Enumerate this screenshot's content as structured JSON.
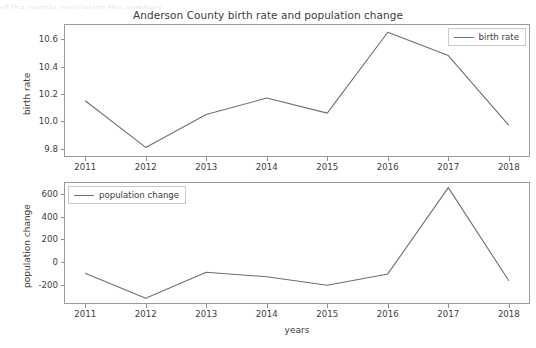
{
  "figure": {
    "title": "Anderson County birth rate and population change",
    "top_bleed_text": "of the people population the numbers"
  },
  "chart_data": [
    {
      "type": "line",
      "id": "birth-rate",
      "title": "Anderson County birth rate and population change",
      "xlabel": "",
      "ylabel": "birth rate",
      "legend": [
        "birth rate"
      ],
      "legend_position": "upper right",
      "grid": false,
      "x": [
        2011,
        2012,
        2013,
        2014,
        2015,
        2016,
        2017,
        2018
      ],
      "categories": [
        "2011",
        "2012",
        "2013",
        "2014",
        "2015",
        "2016",
        "2017",
        "2018"
      ],
      "xtick_labels": [
        "2011",
        "2012",
        "2013",
        "2014",
        "2015",
        "2016",
        "2017",
        "2018"
      ],
      "ytick_labels": [
        "9.8",
        "10.0",
        "10.2",
        "10.4",
        "10.6"
      ],
      "yticks": [
        9.8,
        10.0,
        10.2,
        10.4,
        10.6
      ],
      "ylim": [
        9.74,
        10.71
      ],
      "xlim": [
        2010.65,
        2018.35
      ],
      "series": [
        {
          "name": "birth rate",
          "color": "#6f6f6f",
          "values": [
            10.15,
            9.81,
            10.05,
            10.17,
            10.06,
            10.65,
            10.48,
            9.97
          ]
        }
      ]
    },
    {
      "type": "line",
      "id": "population-change",
      "title": "",
      "xlabel": "years",
      "ylabel": "population change",
      "legend": [
        "population change"
      ],
      "legend_position": "upper left",
      "grid": false,
      "x": [
        2011,
        2012,
        2013,
        2014,
        2015,
        2016,
        2017,
        2018
      ],
      "categories": [
        "2011",
        "2012",
        "2013",
        "2014",
        "2015",
        "2016",
        "2017",
        "2018"
      ],
      "xtick_labels": [
        "2011",
        "2012",
        "2013",
        "2014",
        "2015",
        "2016",
        "2017",
        "2018"
      ],
      "ytick_labels": [
        "-200",
        "0",
        "200",
        "400",
        "600"
      ],
      "yticks": [
        -200,
        0,
        200,
        400,
        600
      ],
      "ylim": [
        -370,
        705
      ],
      "xlim": [
        2010.65,
        2018.35
      ],
      "series": [
        {
          "name": "population change",
          "color": "#6f6f6f",
          "values": [
            -100,
            -320,
            -90,
            -130,
            -205,
            -105,
            655,
            -165
          ]
        }
      ]
    }
  ]
}
